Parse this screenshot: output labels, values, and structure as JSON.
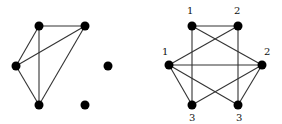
{
  "graphs": [
    {
      "id": "left-graph",
      "nodes": [
        {
          "id": "a",
          "x": 39,
          "y": 26,
          "label": ""
        },
        {
          "id": "b",
          "x": 85,
          "y": 26,
          "label": ""
        },
        {
          "id": "c",
          "x": 16,
          "y": 66,
          "label": ""
        },
        {
          "id": "d",
          "x": 108,
          "y": 66,
          "label": ""
        },
        {
          "id": "e",
          "x": 39,
          "y": 105,
          "label": ""
        },
        {
          "id": "f",
          "x": 85,
          "y": 105,
          "label": ""
        }
      ],
      "edges": [
        [
          "a",
          "b"
        ],
        [
          "a",
          "c"
        ],
        [
          "a",
          "e"
        ],
        [
          "b",
          "c"
        ],
        [
          "b",
          "e"
        ],
        [
          "c",
          "e"
        ]
      ]
    },
    {
      "id": "right-graph",
      "nodes": [
        {
          "id": "tl",
          "x": 192,
          "y": 26,
          "label": "1",
          "lx": 187,
          "ly": 14
        },
        {
          "id": "tr",
          "x": 238,
          "y": 26,
          "label": "2",
          "lx": 234,
          "ly": 14
        },
        {
          "id": "l",
          "x": 169,
          "y": 65,
          "label": "1",
          "lx": 162,
          "ly": 55
        },
        {
          "id": "r",
          "x": 262,
          "y": 65,
          "label": "2",
          "lx": 264,
          "ly": 55
        },
        {
          "id": "bl",
          "x": 192,
          "y": 105,
          "label": "3",
          "lx": 189,
          "ly": 121
        },
        {
          "id": "br",
          "x": 238,
          "y": 105,
          "label": "3",
          "lx": 236,
          "ly": 121
        }
      ],
      "edges": [
        [
          "tl",
          "tr"
        ],
        [
          "tl",
          "r"
        ],
        [
          "tl",
          "bl"
        ],
        [
          "tr",
          "l"
        ],
        [
          "tr",
          "br"
        ],
        [
          "l",
          "r"
        ],
        [
          "l",
          "bl"
        ],
        [
          "l",
          "br"
        ],
        [
          "r",
          "bl"
        ],
        [
          "r",
          "br"
        ]
      ]
    }
  ]
}
